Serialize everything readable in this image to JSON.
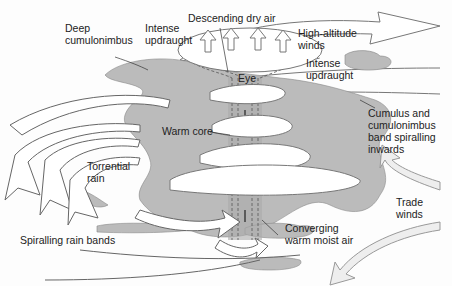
{
  "diagram": {
    "colors": {
      "cloud": "#b9b9b9",
      "cloud_dark": "#a9a9a9",
      "arrow_fill": "#ffffff",
      "arrow_stroke": "#666666",
      "text": "#222222",
      "trade_winds": "#eeeeee"
    },
    "labels": {
      "deep_cumulonimbus": "Deep\ncumulonimbus",
      "intense_updraught_left": "Intense\nupdraught",
      "descending_dry_air": "Descending dry air",
      "high_altitude_winds": "High-altitude\nwinds",
      "eye": "Eye",
      "intense_updraught_right": "Intense\nupdraught",
      "cumulus_band": "Cumulus and\ncumulonimbus\nband spiralling\ninwards",
      "warm_core": "Warm core",
      "torrential_rain": "Torrential\nrain",
      "trade_winds": "Trade\nwinds",
      "spiralling_rain_bands": "Spiralling rain bands",
      "converging_air": "Converging\nwarm moist air"
    }
  }
}
